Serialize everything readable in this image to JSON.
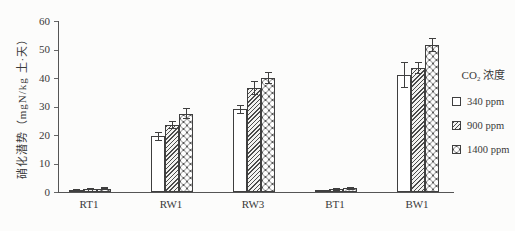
{
  "figure": {
    "background": "#fcfcfb",
    "axis_color": "#555555",
    "bar_outline_color": "#3f3f3f"
  },
  "y_axis": {
    "label": "硝化潜势（mgN/kg 土·天）",
    "ticks": [
      0,
      10,
      20,
      30,
      40,
      50,
      60
    ]
  },
  "legend": {
    "title": "CO₂ 浓度",
    "items": [
      "340 ppm",
      "900 ppm",
      "1400 ppm"
    ]
  },
  "chart_data": {
    "type": "bar",
    "title": "",
    "xlabel": "",
    "ylabel": "硝化潜势（mgN/kg 土·天）",
    "ylim": [
      0,
      60
    ],
    "grid": false,
    "legend_position": "right",
    "legend_title": "CO₂ 浓度",
    "categories": [
      "RT1",
      "RW1",
      "RW3",
      "BT1",
      "BW1"
    ],
    "series": [
      {
        "name": "340 ppm",
        "pattern": "plain",
        "values": [
          0.8,
          19.5,
          29,
          0.3,
          41
        ],
        "errors": [
          0.3,
          1.5,
          1.5,
          0.3,
          4.5
        ]
      },
      {
        "name": "900 ppm",
        "pattern": "hatch",
        "values": [
          1.1,
          23.5,
          36.5,
          0.9,
          43.5
        ],
        "errors": [
          0.3,
          1.5,
          2.5,
          0.4,
          2
        ]
      },
      {
        "name": "1400 ppm",
        "pattern": "balls",
        "values": [
          1.2,
          27.5,
          40,
          1.3,
          51.5
        ],
        "errors": [
          0.3,
          2,
          2,
          0.5,
          2.5
        ]
      }
    ]
  }
}
